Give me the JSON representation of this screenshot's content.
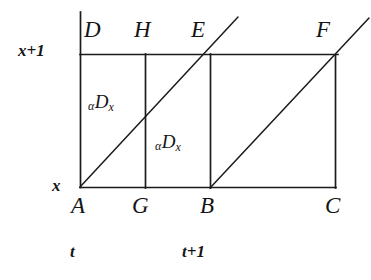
{
  "figure": {
    "background_color": "#ffffff",
    "line_color": "#1b1b1b",
    "axes": {
      "y_ticks": [
        {
          "id": "y-upper",
          "text": "x+1",
          "x": 18,
          "y": 42
        },
        {
          "id": "y-lower",
          "text": "x",
          "x": 52,
          "y": 177
        }
      ],
      "x_ticks": [
        {
          "id": "t-tick",
          "text": "t",
          "x": 70,
          "y": 243
        },
        {
          "id": "t-plus-1-tick",
          "text": "t+1",
          "x": 182,
          "y": 243
        }
      ]
    },
    "vertices": [
      {
        "id": "D",
        "text": "D",
        "x": 84,
        "y": 18
      },
      {
        "id": "H",
        "text": "H",
        "x": 134,
        "y": 18
      },
      {
        "id": "E",
        "text": "E",
        "x": 191,
        "y": 18
      },
      {
        "id": "F",
        "text": "F",
        "x": 316,
        "y": 18
      },
      {
        "id": "A",
        "text": "A",
        "x": 71,
        "y": 194
      },
      {
        "id": "G",
        "text": "G",
        "x": 132,
        "y": 194
      },
      {
        "id": "B",
        "text": "B",
        "x": 200,
        "y": 194
      },
      {
        "id": "C",
        "text": "C",
        "x": 325,
        "y": 194
      }
    ],
    "region_labels": [
      {
        "id": "region-ADHG",
        "alpha": "α",
        "main": "D",
        "sub": "x",
        "x": 88,
        "y": 92
      },
      {
        "id": "region-GHEB",
        "alpha": "α",
        "main": "D",
        "sub": "x",
        "x": 155,
        "y": 132
      }
    ],
    "geometry": {
      "y_axis_x": 80,
      "top_line_y": 54,
      "bottom_line_y": 187,
      "axis_top_y": 12,
      "x_positions": {
        "A": 80,
        "G": 145,
        "B": 210,
        "C": 335
      },
      "top_line_x_end": 337,
      "bottom_line_x_end": 335,
      "diagonal_1": {
        "x1": 80,
        "y1": 187,
        "x2": 238,
        "y2": 17
      },
      "diagonal_2": {
        "x1": 210,
        "y1": 188,
        "x2": 369,
        "y2": 18
      }
    }
  }
}
